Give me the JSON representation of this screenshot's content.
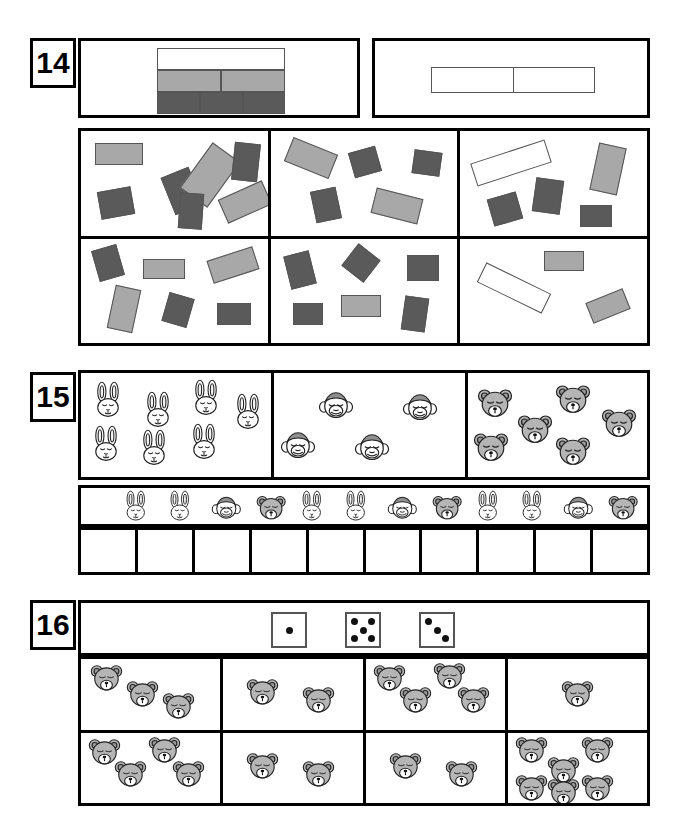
{
  "worksheet": {
    "page_background": "#ffffff",
    "colors": {
      "white": "#ffffff",
      "light_gray": "#a8a8a8",
      "dark_gray": "#5a5a5a",
      "outline": "#555555",
      "border": "#000000",
      "bear_fill": "#b5b5b5"
    }
  },
  "exercises": [
    {
      "number": "14",
      "key": {
        "label": "rectangle-color-key",
        "rows": [
          {
            "color": "white",
            "count": 1
          },
          {
            "color": "light_gray",
            "count": 2
          },
          {
            "color": "dark_gray",
            "count": 3
          }
        ]
      },
      "answer_boxes": {
        "count": 2,
        "values": [
          "",
          ""
        ]
      },
      "cells": [
        {
          "index": 1,
          "white": 0,
          "light_gray": 3,
          "dark_gray": 4,
          "shapes": [
            {
              "c": "light_gray",
              "x": 14,
              "y": 12,
              "w": 48,
              "h": 22,
              "r": 0
            },
            {
              "c": "dark_gray",
              "x": 86,
              "y": 40,
              "w": 30,
              "h": 40,
              "r": -22
            },
            {
              "c": "light_gray",
              "x": 112,
              "y": 16,
              "w": 34,
              "h": 56,
              "r": 36
            },
            {
              "c": "dark_gray",
              "x": 152,
              "y": 12,
              "w": 26,
              "h": 38,
              "r": 6
            },
            {
              "c": "dark_gray",
              "x": 18,
              "y": 58,
              "w": 34,
              "h": 28,
              "r": -10
            },
            {
              "c": "dark_gray",
              "x": 98,
              "y": 62,
              "w": 24,
              "h": 36,
              "r": 4
            },
            {
              "c": "light_gray",
              "x": 140,
              "y": 58,
              "w": 48,
              "h": 26,
              "r": -24
            }
          ]
        },
        {
          "index": 2,
          "white": 0,
          "light_gray": 2,
          "dark_gray": 3,
          "shapes": [
            {
              "c": "light_gray",
              "x": 16,
              "y": 14,
              "w": 48,
              "h": 26,
              "r": 22
            },
            {
              "c": "dark_gray",
              "x": 80,
              "y": 18,
              "w": 28,
              "h": 26,
              "r": -16
            },
            {
              "c": "dark_gray",
              "x": 142,
              "y": 20,
              "w": 28,
              "h": 24,
              "r": 8
            },
            {
              "c": "dark_gray",
              "x": 42,
              "y": 58,
              "w": 26,
              "h": 32,
              "r": -12
            },
            {
              "c": "light_gray",
              "x": 102,
              "y": 62,
              "w": 48,
              "h": 26,
              "r": 14
            }
          ]
        },
        {
          "index": 3,
          "white": 1,
          "light_gray": 1,
          "dark_gray": 3,
          "shapes": [
            {
              "c": "white",
              "x": 12,
              "y": 20,
              "w": 78,
              "h": 24,
              "r": -18
            },
            {
              "c": "light_gray",
              "x": 134,
              "y": 14,
              "w": 28,
              "h": 48,
              "r": 12
            },
            {
              "c": "dark_gray",
              "x": 74,
              "y": 48,
              "w": 28,
              "h": 34,
              "r": 8
            },
            {
              "c": "dark_gray",
              "x": 30,
              "y": 64,
              "w": 30,
              "h": 28,
              "r": -16
            },
            {
              "c": "dark_gray",
              "x": 120,
              "y": 74,
              "w": 32,
              "h": 22,
              "r": 0
            }
          ]
        },
        {
          "index": 4,
          "white": 0,
          "light_gray": 3,
          "dark_gray": 3,
          "shapes": [
            {
              "c": "dark_gray",
              "x": 14,
              "y": 8,
              "w": 26,
              "h": 32,
              "r": -16
            },
            {
              "c": "light_gray",
              "x": 62,
              "y": 20,
              "w": 42,
              "h": 20,
              "r": 0
            },
            {
              "c": "light_gray",
              "x": 128,
              "y": 14,
              "w": 48,
              "h": 24,
              "r": -18
            },
            {
              "c": "light_gray",
              "x": 30,
              "y": 48,
              "w": 26,
              "h": 44,
              "r": 12
            },
            {
              "c": "dark_gray",
              "x": 84,
              "y": 56,
              "w": 26,
              "h": 30,
              "r": 16
            },
            {
              "c": "dark_gray",
              "x": 136,
              "y": 64,
              "w": 34,
              "h": 22,
              "r": 0
            }
          ]
        },
        {
          "index": 5,
          "white": 0,
          "light_gray": 1,
          "dark_gray": 5,
          "shapes": [
            {
              "c": "dark_gray",
              "x": 16,
              "y": 14,
              "w": 26,
              "h": 34,
              "r": -14
            },
            {
              "c": "dark_gray",
              "x": 76,
              "y": 10,
              "w": 28,
              "h": 28,
              "r": 38
            },
            {
              "c": "dark_gray",
              "x": 136,
              "y": 16,
              "w": 32,
              "h": 26,
              "r": 0
            },
            {
              "c": "dark_gray",
              "x": 22,
              "y": 64,
              "w": 30,
              "h": 22,
              "r": 0
            },
            {
              "c": "light_gray",
              "x": 70,
              "y": 56,
              "w": 40,
              "h": 22,
              "r": 0
            },
            {
              "c": "dark_gray",
              "x": 132,
              "y": 58,
              "w": 24,
              "h": 34,
              "r": 8
            }
          ]
        },
        {
          "index": 6,
          "white": 1,
          "light_gray": 2,
          "dark_gray": 0,
          "shapes": [
            {
              "c": "light_gray",
              "x": 84,
              "y": 12,
              "w": 40,
              "h": 20,
              "r": 0
            },
            {
              "c": "white",
              "x": 18,
              "y": 38,
              "w": 72,
              "h": 22,
              "r": 26
            },
            {
              "c": "light_gray",
              "x": 128,
              "y": 56,
              "w": 40,
              "h": 22,
              "r": -22
            }
          ]
        }
      ]
    },
    {
      "number": "15",
      "groups": [
        {
          "animal": "rabbit",
          "count": 9
        },
        {
          "animal": "monkey",
          "count": 4
        },
        {
          "animal": "bear",
          "count": 6
        }
      ],
      "pattern_strip": {
        "length": 12,
        "sequence": [
          "rabbit",
          "rabbit",
          "monkey",
          "bear",
          "rabbit",
          "rabbit",
          "monkey",
          "bear",
          "rabbit",
          "rabbit",
          "monkey",
          "bear"
        ]
      },
      "answer_boxes": {
        "count": 10,
        "values": [
          "",
          "",
          "",
          "",
          "",
          "",
          "",
          "",
          "",
          ""
        ]
      }
    },
    {
      "number": "16",
      "dice": [
        {
          "pips": 1
        },
        {
          "pips": 5
        },
        {
          "pips": 3
        }
      ],
      "cells": [
        {
          "index": 1,
          "animal": "bear",
          "count": 3
        },
        {
          "index": 2,
          "animal": "bear",
          "count": 2
        },
        {
          "index": 3,
          "animal": "bear",
          "count": 4
        },
        {
          "index": 4,
          "animal": "bear",
          "count": 1
        },
        {
          "index": 5,
          "animal": "bear",
          "count": 4
        },
        {
          "index": 6,
          "animal": "bear",
          "count": 2
        },
        {
          "index": 7,
          "animal": "bear",
          "count": 2
        },
        {
          "index": 8,
          "animal": "bear",
          "count": 6
        }
      ]
    }
  ]
}
